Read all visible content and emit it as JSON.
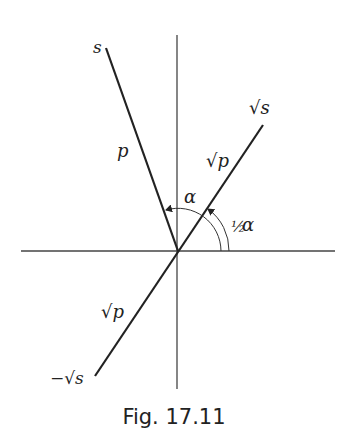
{
  "figure": {
    "caption": "Fig. 17.11",
    "colors": {
      "ink": "#222222",
      "axis": "#444444",
      "background": "#ffffff"
    },
    "origin": [
      178,
      251
    ],
    "axes": {
      "horizontal": {
        "from": [
          21,
          251
        ],
        "to": [
          335,
          251
        ]
      },
      "vertical": {
        "from": [
          177,
          35
        ],
        "to": [
          177,
          389
        ]
      }
    },
    "lines": [
      {
        "name": "s-ray",
        "from": [
          178,
          251
        ],
        "to": [
          106,
          48
        ]
      },
      {
        "name": "sqrt-s-line",
        "from": [
          95,
          376
        ],
        "to": [
          263,
          125
        ]
      }
    ],
    "labels": {
      "s": "s",
      "p": "p",
      "sqrt_s": "√s",
      "neg_sqrt_s": "−√s",
      "sqrt_p_upper": "√p",
      "sqrt_p_lower": "√p",
      "alpha": "α",
      "half": "½",
      "half_alpha_symbol": "α"
    },
    "angles": [
      {
        "name": "alpha",
        "label": "α",
        "radius": 43,
        "from_deg": 0,
        "to_deg": 109.6
      },
      {
        "name": "half-alpha",
        "label": "½α",
        "radius": 51,
        "from_deg": 0,
        "to_deg": 55.8
      }
    ]
  }
}
